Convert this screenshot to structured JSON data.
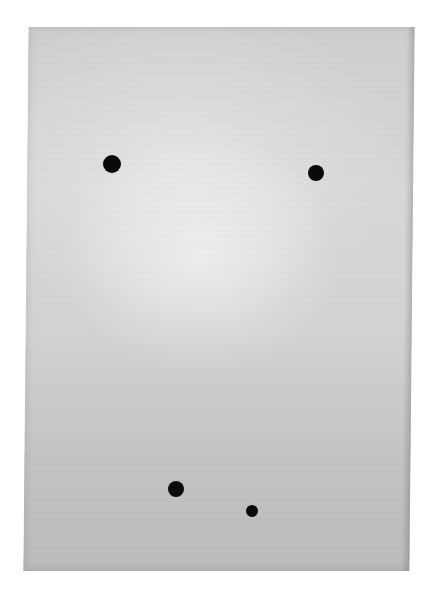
{
  "scene": {
    "description": "Gray sheet of paper on white background with four black dots",
    "background_color": "#ffffff",
    "paper_color": "#d2d2d2",
    "dot_color": "#0a0a0a"
  },
  "dots": [
    {
      "x": 112,
      "y": 164,
      "diameter": 18
    },
    {
      "x": 316,
      "y": 173,
      "diameter": 16
    },
    {
      "x": 176,
      "y": 489,
      "diameter": 16
    },
    {
      "x": 252,
      "y": 511,
      "diameter": 12
    }
  ]
}
